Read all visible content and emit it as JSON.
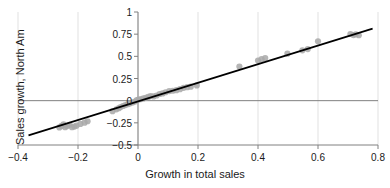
{
  "chart_data": {
    "type": "scatter",
    "title": "",
    "xlabel": "Growth in total sales",
    "ylabel": "Sales growth, North Am",
    "xlim": [
      -0.4,
      0.8
    ],
    "ylim": [
      -0.5,
      1
    ],
    "xticks": [
      "-0.4",
      "-0.2",
      "0",
      "0.2",
      "0.4",
      "0.6",
      "0.8"
    ],
    "xtick_values": [
      -0.4,
      -0.2,
      0,
      0.2,
      0.4,
      0.6,
      0.8
    ],
    "yticks": [
      "1",
      "0.75",
      "0.5",
      "0.25",
      "0",
      "-0.25",
      "-0.5"
    ],
    "ytick_values": [
      1,
      0.75,
      0.5,
      0.25,
      0,
      -0.25,
      -0.5
    ],
    "grid": true,
    "legend": false,
    "marker_color": "#a8a8a8",
    "line_color": "#000000",
    "axis_color": "#808080",
    "grid_color": "#d9d9d9",
    "series": [
      {
        "name": "observations",
        "points": [
          [
            -0.262,
            -0.302
          ],
          [
            -0.255,
            -0.285
          ],
          [
            -0.248,
            -0.268
          ],
          [
            -0.243,
            -0.3
          ],
          [
            -0.236,
            -0.286
          ],
          [
            -0.228,
            -0.272
          ],
          [
            -0.22,
            -0.3
          ],
          [
            -0.212,
            -0.292
          ],
          [
            -0.205,
            -0.282
          ],
          [
            -0.192,
            -0.262
          ],
          [
            -0.178,
            -0.248
          ],
          [
            -0.168,
            -0.232
          ],
          [
            -0.085,
            -0.118
          ],
          [
            -0.072,
            -0.098
          ],
          [
            -0.064,
            -0.085
          ],
          [
            -0.058,
            -0.072
          ],
          [
            -0.05,
            -0.06
          ],
          [
            -0.042,
            -0.05
          ],
          [
            -0.034,
            -0.04
          ],
          [
            -0.026,
            -0.03
          ],
          [
            -0.018,
            -0.02
          ],
          [
            -0.01,
            -0.01
          ],
          [
            -0.004,
            0.005
          ],
          [
            0.002,
            0.012
          ],
          [
            0.01,
            0.018
          ],
          [
            0.018,
            0.025
          ],
          [
            0.026,
            0.032
          ],
          [
            0.034,
            0.042
          ],
          [
            0.042,
            0.052
          ],
          [
            0.052,
            0.048
          ],
          [
            0.062,
            0.058
          ],
          [
            0.072,
            0.075
          ],
          [
            0.082,
            0.082
          ],
          [
            0.092,
            0.095
          ],
          [
            0.104,
            0.108
          ],
          [
            0.116,
            0.112
          ],
          [
            0.128,
            0.118
          ],
          [
            0.14,
            0.13
          ],
          [
            0.152,
            0.145
          ],
          [
            0.164,
            0.152
          ],
          [
            0.176,
            0.158
          ],
          [
            0.196,
            0.172
          ],
          [
            0.338,
            0.385
          ],
          [
            0.4,
            0.452
          ],
          [
            0.412,
            0.468
          ],
          [
            0.424,
            0.48
          ],
          [
            0.498,
            0.53
          ],
          [
            0.548,
            0.568
          ],
          [
            0.566,
            0.582
          ],
          [
            0.6,
            0.67
          ],
          [
            0.708,
            0.752
          ],
          [
            0.718,
            0.74
          ],
          [
            0.726,
            0.748
          ],
          [
            0.736,
            0.738
          ]
        ]
      }
    ],
    "fit_line": {
      "name": "regression-line",
      "x_start": -0.365,
      "y_start": -0.392,
      "x_end": 0.782,
      "y_end": 0.812
    }
  }
}
